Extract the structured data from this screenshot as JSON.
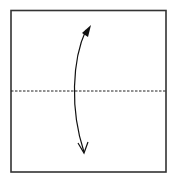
{
  "diagram": {
    "type": "origami-fold-step",
    "paper": {
      "x": 11,
      "y": 10,
      "width": 155,
      "height": 162,
      "stroke": "#333333",
      "fill": "#ffffff"
    },
    "fold_line": {
      "style": "dashed",
      "y": 91,
      "color": "#222222"
    },
    "arrow": {
      "type": "fold-and-unfold",
      "start": [
        84,
        28
      ],
      "end": [
        84,
        152
      ],
      "color": "#111111",
      "head_top": "filled-triangle",
      "head_bottom": "open-chevron"
    }
  }
}
